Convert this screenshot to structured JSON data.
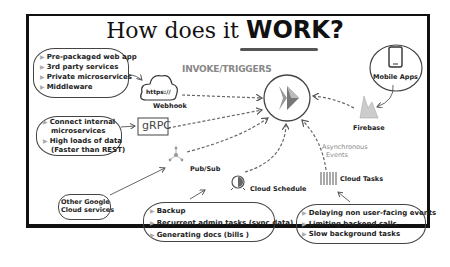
{
  "title": {
    "text": "How does it ",
    "emphasis": "WORK?"
  },
  "center": {
    "label": "INVOKE/TRIGGERS",
    "icon": "cloud-run-icon"
  },
  "sources": {
    "webhook": {
      "label": "Webhook",
      "icon_text": "https://",
      "uses": [
        "Pre-packaged web app",
        "3rd party services",
        "Private microservices",
        "Middleware"
      ]
    },
    "grpc": {
      "label": "gRPC",
      "uses": [
        "Connect internal microservices",
        "High loads of data (Faster than REST)"
      ],
      "uses_lines": [
        "Connect internal",
        "microservices",
        "High loads of data",
        "(Faster than REST)"
      ]
    },
    "pubsub": {
      "label": "Pub/Sub",
      "fed_by": "Other Google Cloud services",
      "fed_by_lines": [
        "Other Google",
        "Cloud services"
      ]
    },
    "scheduler": {
      "label": "Cloud Schedule",
      "uses": [
        "Backup",
        "Recurrent admin tasks (sync data)",
        "Generating docs (bills )"
      ]
    },
    "tasks": {
      "label": "Cloud Tasks",
      "note_lines": [
        "Asynchronous",
        "Events"
      ],
      "uses": [
        "Delaying non user-facing events",
        "Limiting backend calls",
        "Slow background tasks"
      ]
    },
    "firebase": {
      "label": "Firebase",
      "fed_by": "Mobile Apps"
    }
  },
  "colors": {
    "ink": "#222222",
    "gray": "#888888",
    "frame": "#111111"
  }
}
